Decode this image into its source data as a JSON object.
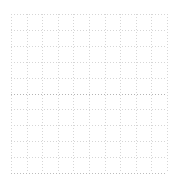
{
  "chart_data": {
    "type": "line",
    "title": "",
    "subtitle": "",
    "xlabel": "",
    "ylabel": "",
    "x": [],
    "values": [],
    "series": [],
    "categories": [],
    "xlim": [
      0,
      10
    ],
    "ylim": [
      0,
      10
    ],
    "xticks": [
      0,
      1,
      2,
      3,
      4,
      5,
      6,
      7,
      8,
      9,
      10
    ],
    "yticks": [
      0,
      1,
      2,
      3,
      4,
      5,
      6,
      7,
      8,
      9,
      10
    ],
    "xtick_labels": [
      "",
      "",
      "",
      "",
      "",
      "",
      "",
      "",
      "",
      "",
      ""
    ],
    "ytick_labels": [
      "",
      "",
      "",
      "",
      "",
      "",
      "",
      "",
      "",
      "",
      ""
    ],
    "grid": true,
    "grid_style": "dotted",
    "grid_color": "#d6d6d6",
    "grid_columns": 10,
    "grid_rows": 10,
    "legend": [],
    "legend_position": "none",
    "annotations": [],
    "background_color": "#ffffff",
    "emphasis_line_color": "#b4b4b4",
    "baseline_color": "#bdbdbd"
  },
  "plot": {
    "left": 11,
    "top": 14,
    "width": 156,
    "height": 159,
    "cell_size": 15.6,
    "emphasis_row_index": 5,
    "baseline_row_index": 10
  },
  "canvas": {
    "width": 180,
    "height": 183
  }
}
